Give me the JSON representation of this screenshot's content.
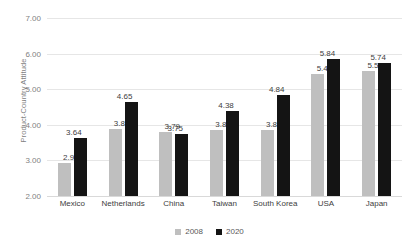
{
  "chart_data": {
    "type": "bar",
    "title": "",
    "xlabel": "",
    "ylabel": "Product-Country Attitude",
    "ylim": [
      2.0,
      7.0
    ],
    "ytick_step": 1.0,
    "ytick_labels": [
      "7.00",
      "6.00",
      "5.00",
      "4.00",
      "3.00",
      "2.00"
    ],
    "ytick_values": [
      7.0,
      6.0,
      5.0,
      4.0,
      3.0,
      2.0
    ],
    "grid": true,
    "legend_position": "bottom-center",
    "categories": [
      "Mexico",
      "Netherlands",
      "China",
      "Taiwan",
      "South Korea",
      "USA",
      "Japan"
    ],
    "series": [
      {
        "name": "2008",
        "color": "#bfbfbf",
        "values": [
          2.92,
          3.87,
          3.79,
          3.86,
          3.85,
          5.43,
          5.51
        ],
        "labels": [
          "2.92",
          "3.87",
          "3.79",
          "3.86",
          "3.85",
          "5.43",
          "5.51"
        ]
      },
      {
        "name": "2020",
        "color": "#141414",
        "values": [
          3.64,
          4.65,
          3.75,
          4.38,
          4.84,
          5.84,
          5.74
        ],
        "labels": [
          "3.64",
          "4.65",
          "3.75",
          "4.38",
          "4.84",
          "5.84",
          "5.74"
        ]
      }
    ]
  },
  "colors": {
    "series_2008": "#bfbfbf",
    "series_2020": "#141414",
    "gridline": "#e6e6e6",
    "axis_text": "#7f7f7f",
    "label_text": "#404040",
    "background": "#ffffff"
  }
}
